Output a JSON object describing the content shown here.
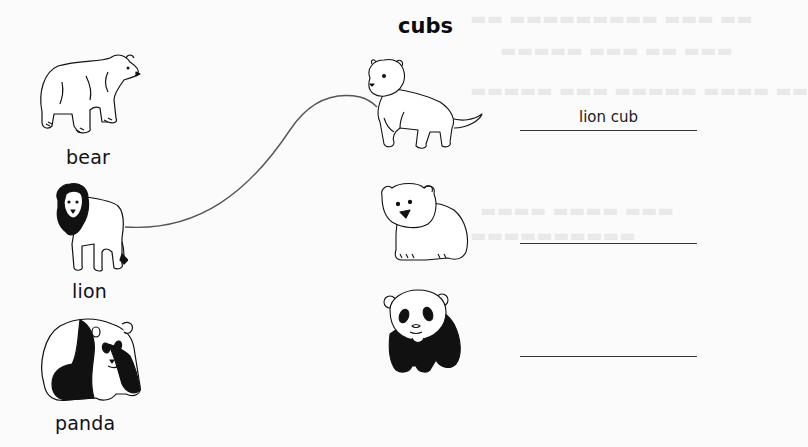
{
  "worksheet": {
    "heading": "cubs",
    "adults": [
      {
        "name": "bear-adult",
        "label": "bear",
        "icon": "polar-bear-icon"
      },
      {
        "name": "lion-adult",
        "label": "lion",
        "icon": "lion-icon"
      },
      {
        "name": "panda-adult",
        "label": "panda",
        "icon": "panda-icon"
      }
    ],
    "cubs": [
      {
        "name": "lion-cub",
        "icon": "lion-cub-icon",
        "answer": "lion cub"
      },
      {
        "name": "bear-cub",
        "icon": "bear-cub-icon",
        "answer": ""
      },
      {
        "name": "panda-cub",
        "icon": "panda-cub-icon",
        "answer": ""
      }
    ],
    "connections": [
      {
        "from": "lion",
        "to": "lion cub"
      }
    ],
    "colors": {
      "paper": "#fbfbfb",
      "ink": "#111111",
      "line": "#333333"
    }
  }
}
